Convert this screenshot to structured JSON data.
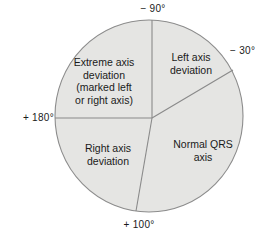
{
  "figure": {
    "name": "cardiac-axis-circle-diagram",
    "background_color": "#ffffff",
    "circle": {
      "fill_color": "#e5e5e3",
      "stroke_color": "#8c8c8c",
      "center_x": 149,
      "center_y": 116,
      "radius_x": 94,
      "radius_y": 96
    },
    "divider_color": "#8a8a8a"
  },
  "degree_labels": {
    "top": "− 90°",
    "upper_right": "− 30°",
    "left": "+ 180°",
    "bottom": "+ 100°"
  },
  "sectors": [
    {
      "key": "extreme_axis_deviation",
      "lines": [
        "Extreme axis",
        "deviation",
        "(marked left",
        "or right axis)"
      ],
      "start_deg": -90,
      "end_deg": 180
    },
    {
      "key": "left_axis_deviation",
      "lines": [
        "Left axis",
        "deviation"
      ],
      "start_deg": -90,
      "end_deg": -30
    },
    {
      "key": "normal_qrs_axis",
      "lines": [
        "Normal QRS",
        "axis"
      ],
      "start_deg": -30,
      "end_deg": 100
    },
    {
      "key": "right_axis_deviation",
      "lines": [
        "Right axis",
        "deviation"
      ],
      "start_deg": 100,
      "end_deg": 180
    }
  ],
  "sector_text": {
    "extreme_line1": "Extreme axis",
    "extreme_line2": "deviation",
    "extreme_line3": "(marked left",
    "extreme_line4": "or right axis)",
    "left_line1": "Left axis",
    "left_line2": "deviation",
    "normal_line1": "Normal QRS",
    "normal_line2": "axis",
    "right_line1": "Right axis",
    "right_line2": "deviation"
  }
}
